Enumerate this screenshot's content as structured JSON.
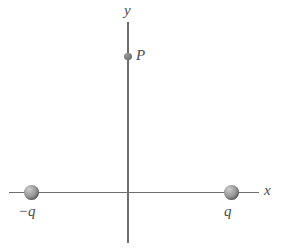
{
  "figure": {
    "background_color": "#ffffff",
    "axis_color": "#6e6e6e",
    "label_color": "#4a4a4a",
    "sphere_color": "#9a9a9a"
  },
  "axes": {
    "x_label": "x",
    "y_label": "y",
    "origin_x": 128,
    "origin_y": 192
  },
  "charges": [
    {
      "label": "−q",
      "sign": "negative",
      "position_x": 31,
      "position_y": 192
    },
    {
      "label": "q",
      "sign": "positive",
      "position_x": 231,
      "position_y": 192
    }
  ],
  "points": [
    {
      "label": "P",
      "position_x": 128,
      "position_y": 56
    }
  ],
  "chart_data": {
    "type": "scatter",
    "xlabel": "x",
    "ylabel": "y",
    "grid": false,
    "legend": null,
    "xlim": [
      -2.0,
      1.4
    ],
    "ylim": [
      -1.6,
      1.8
    ],
    "series": [
      {
        "name": "charges",
        "points": [
          {
            "label": "−q",
            "x": -1.0,
            "y": 0.0
          },
          {
            "label": "q",
            "x": 1.0,
            "y": 0.0
          }
        ]
      },
      {
        "name": "field-point",
        "points": [
          {
            "label": "P",
            "x": 0.0,
            "y": 1.36
          }
        ]
      }
    ],
    "annotations": [
      "−q",
      "q",
      "P",
      "x",
      "y"
    ]
  }
}
